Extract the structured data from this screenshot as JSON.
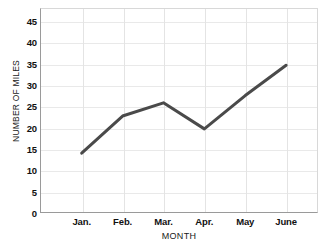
{
  "chart_data": {
    "type": "line",
    "title": "",
    "xlabel": "MONTH",
    "ylabel": "NUMBER OF MILES",
    "categories": [
      "Jan.",
      "Feb.",
      "Mar.",
      "Apr.",
      "May",
      "June"
    ],
    "values": [
      14,
      22.7,
      25.8,
      19.7,
      27.5,
      34.6
    ],
    "series": [
      {
        "name": "Number of miles",
        "values": [
          14,
          22.7,
          25.8,
          19.7,
          27.5,
          34.6
        ]
      }
    ],
    "ylim": [
      0,
      48
    ],
    "yticks": [
      0,
      5,
      10,
      15,
      20,
      25,
      30,
      35,
      40,
      45
    ],
    "ytick_labels": [
      "0",
      "5",
      "10",
      "15",
      "20",
      "25",
      "30",
      "35",
      "40",
      "45"
    ],
    "xtick_labels": [
      "Jan.",
      "Feb.",
      "Mar.",
      "Apr.",
      "May",
      "June"
    ],
    "grid": true,
    "legend": false,
    "legend_position": "none",
    "line_color": "#4a4a4a",
    "line_width": 3,
    "markers": false,
    "grid_color": "#e7e7e7",
    "axis_color": "#9a9a9a",
    "background_color": "#ffffff",
    "text_color": "#111111"
  }
}
